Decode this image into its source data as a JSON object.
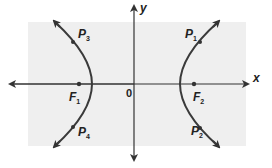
{
  "diagram": {
    "type": "hyperbola",
    "axes": {
      "x_label": "x",
      "y_label": "y",
      "origin_label": "0"
    },
    "foci": [
      {
        "name": "F",
        "sub": "1"
      },
      {
        "name": "F",
        "sub": "2"
      }
    ],
    "points": [
      {
        "name": "P",
        "sub": "1"
      },
      {
        "name": "P",
        "sub": "2"
      },
      {
        "name": "P",
        "sub": "3"
      },
      {
        "name": "P",
        "sub": "4"
      }
    ],
    "colors": {
      "background_panel": "#efefef",
      "curve": "#3a3a3a",
      "axes": "#333333"
    }
  }
}
